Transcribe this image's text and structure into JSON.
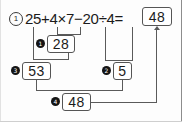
{
  "problem": {
    "number_label": "1",
    "expression": "25+4×7−20÷4=",
    "answer": "48"
  },
  "steps": [
    {
      "marker": "1",
      "result": "28",
      "operation": "4×7"
    },
    {
      "marker": "2",
      "result": "5",
      "operation": "20÷4"
    },
    {
      "marker": "3",
      "result": "53",
      "operation": "25+28"
    },
    {
      "marker": "4",
      "result": "48",
      "operation": "53−5"
    }
  ],
  "colors": {
    "ink": "#1b1b1b",
    "rule": "#5a5a5a",
    "box_border": "#555555",
    "bullet_fill": "#141414",
    "page": "#fdfdfd"
  }
}
